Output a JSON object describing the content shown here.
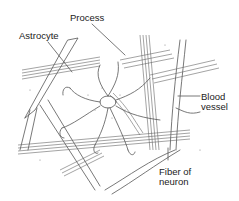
{
  "diagram": {
    "labels": {
      "process": "Process",
      "astrocyte": "Astrocyte",
      "blood_vessel_line1": "Blood",
      "blood_vessel_line2": "vessel",
      "fiber_line1": "Fiber of",
      "fiber_line2": "neuron"
    },
    "colors": {
      "line": "#555555",
      "text": "#222222",
      "background": "#ffffff"
    }
  }
}
